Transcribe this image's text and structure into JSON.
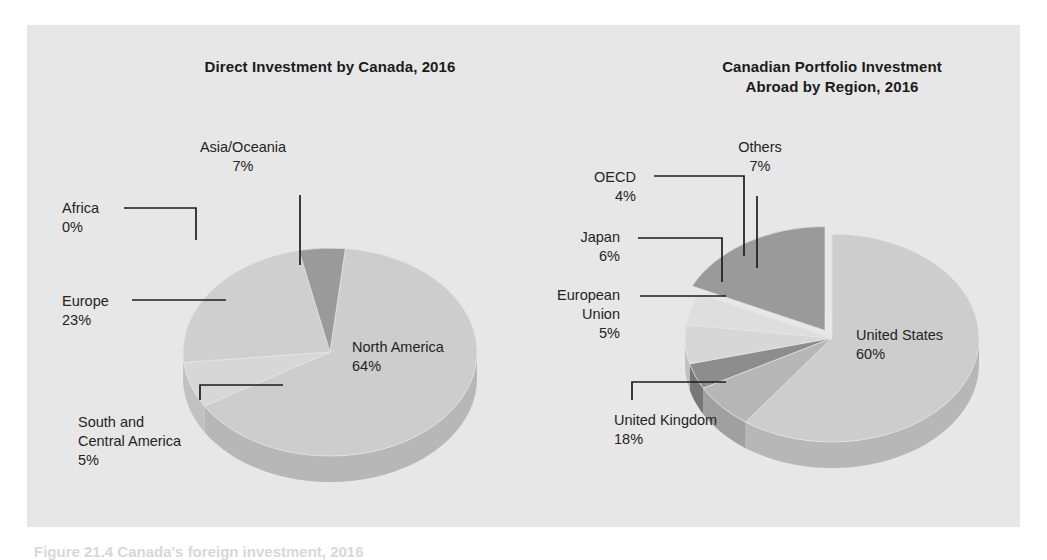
{
  "panel": {
    "background": "#e7e7e7",
    "page_background": "#ffffff"
  },
  "caption": {
    "partial_text": "Figure 21.4  Canada's foreign investment, 2016"
  },
  "palette": {
    "light": "#cdcdcd",
    "lighter": "#d7d7d7",
    "mid": "#b6b6b6",
    "dark": "#9a9a9a",
    "darker": "#8d8d8d",
    "pale": "#dedede",
    "side_light": "#e2e2e2",
    "side_dark": "#bcbcbc",
    "leader": "#1d1d1d",
    "text": "#242424",
    "title": "#1b1b1b"
  },
  "chart_data": [
    {
      "type": "pie",
      "title": "Direct Investment by Canada, 2016",
      "title_lines": [
        "Direct Investment by Canada, 2016"
      ],
      "center": [
        330,
        352
      ],
      "rx": 147,
      "ry": 104,
      "depth": 26,
      "start_angle": -84,
      "categories": [
        "North America",
        "Asia/Oceania",
        "Africa",
        "Europe",
        "South and Central America"
      ],
      "values": [
        64,
        7,
        0,
        23,
        5
      ],
      "labels": [
        {
          "name": "North America",
          "value": "64%",
          "display": [
            "North America",
            "64%"
          ],
          "color": "#cdcdcd",
          "inside": true,
          "x": 352,
          "y": 352
        },
        {
          "name": "Asia/Oceania",
          "value": "7%",
          "display": [
            "Asia/Oceania",
            "7%"
          ],
          "color": "#d7d7d7",
          "inside": false,
          "x": 243,
          "y": 152,
          "anchor": "middle"
        },
        {
          "name": "Africa",
          "value": "0%",
          "display": [
            "Africa",
            "0%"
          ],
          "color": "#c4c4c4",
          "inside": false,
          "x": 62,
          "y": 213,
          "anchor": "start"
        },
        {
          "name": "Europe",
          "value": "23%",
          "display": [
            "Europe",
            "23%"
          ],
          "color": "#cfcfcf",
          "inside": false,
          "x": 62,
          "y": 306,
          "anchor": "start"
        },
        {
          "name": "South and Central America",
          "value": "5%",
          "display": [
            "South and",
            "Central America",
            "5%"
          ],
          "color": "#9a9a9a",
          "inside": false,
          "x": 78,
          "y": 427,
          "anchor": "start"
        }
      ]
    },
    {
      "type": "pie",
      "title": "Canadian Portfolio Investment Abroad by Region, 2016",
      "title_lines": [
        "Canadian Portfolio Investment",
        "Abroad by Region, 2016"
      ],
      "center": [
        832,
        338
      ],
      "rx": 147,
      "ry": 104,
      "depth": 26,
      "start_angle": -90,
      "categories": [
        "United States",
        "Others",
        "OECD",
        "Japan",
        "European Union",
        "United Kingdom"
      ],
      "values": [
        60,
        7,
        4,
        6,
        5,
        18
      ],
      "labels": [
        {
          "name": "United States",
          "value": "60%",
          "display": [
            "United States",
            "60%"
          ],
          "color": "#cdcdcd",
          "inside": true,
          "x": 856,
          "y": 340
        },
        {
          "name": "Others",
          "value": "7%",
          "display": [
            "Others",
            "7%"
          ],
          "color": "#b6b6b6",
          "inside": false,
          "x": 760,
          "y": 152,
          "anchor": "middle"
        },
        {
          "name": "OECD",
          "value": "4%",
          "display": [
            "OECD",
            "4%"
          ],
          "color": "#8d8d8d",
          "inside": false,
          "x": 636,
          "y": 182,
          "anchor": "end"
        },
        {
          "name": "Japan",
          "value": "6%",
          "display": [
            "Japan",
            "6%"
          ],
          "color": "#d7d7d7",
          "inside": false,
          "x": 620,
          "y": 242,
          "anchor": "end"
        },
        {
          "name": "European Union",
          "value": "5%",
          "display": [
            "European",
            "Union",
            "5%"
          ],
          "color": "#dedede",
          "inside": false,
          "x": 620,
          "y": 300,
          "anchor": "end"
        },
        {
          "name": "United Kingdom",
          "value": "18%",
          "display": [
            "United Kingdom",
            "18%"
          ],
          "color": "#9a9a9a",
          "inside": false,
          "x": 614,
          "y": 425,
          "anchor": "start",
          "exploded": true
        }
      ]
    }
  ]
}
